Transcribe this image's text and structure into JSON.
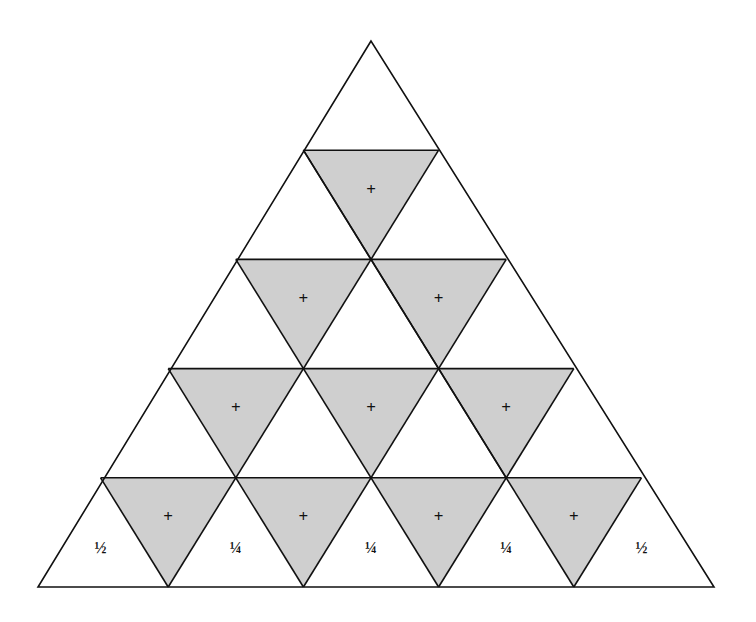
{
  "diagram": {
    "type": "triangular-grid",
    "rows": 5,
    "colors": {
      "shaded": "#cfcfcf",
      "stroke": "#111111",
      "background": "#ffffff"
    },
    "shaded_label": "+",
    "shaded_cells": [
      {
        "row": 1,
        "label": "+"
      },
      {
        "row": 2,
        "label": "+"
      },
      {
        "row": 2,
        "label": "+"
      },
      {
        "row": 3,
        "label": "+"
      },
      {
        "row": 3,
        "label": "+"
      },
      {
        "row": 3,
        "label": "+"
      },
      {
        "row": 4,
        "label": "+"
      },
      {
        "row": 4,
        "label": "+"
      },
      {
        "row": 4,
        "label": "+"
      },
      {
        "row": 4,
        "label": "+"
      }
    ],
    "bottom_row_labels": [
      "½",
      "¼",
      "¼",
      "¼",
      "½"
    ]
  }
}
